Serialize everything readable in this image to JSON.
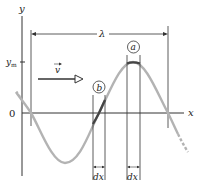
{
  "diagram": {
    "axes": {
      "y_label": "y",
      "x_label": "x",
      "origin_label": "0",
      "amplitude_label": "y",
      "amplitude_subscript": "m"
    },
    "wavelength_label": "λ",
    "velocity_label": "v",
    "points": [
      {
        "id": "a",
        "label": "a",
        "location": "crest"
      },
      {
        "id": "b",
        "label": "b",
        "location": "zero crossing"
      }
    ],
    "element_labels": [
      "dx",
      "dx"
    ],
    "colors": {
      "wave": "#b3b3b3",
      "highlight": "#444444",
      "lines": "#333333",
      "text": "#222222"
    }
  }
}
